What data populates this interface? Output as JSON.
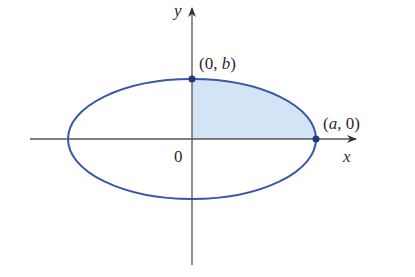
{
  "diagram": {
    "type": "ellipse-first-quadrant-region",
    "labels": {
      "y_axis": "y",
      "x_axis": "x",
      "origin": "0",
      "top_point_open": "(0, ",
      "top_point_var": "b",
      "top_point_close": ")",
      "right_point_open": "(",
      "right_point_var": "a",
      "right_point_close": ", 0)"
    },
    "colors": {
      "ellipse_stroke": "#3a58a8",
      "region_fill": "#d4e4f7",
      "axis": "#555555",
      "point": "#1e3a78"
    },
    "geometry": {
      "center": [
        192,
        139
      ],
      "rx": 124,
      "ry": 60
    }
  }
}
